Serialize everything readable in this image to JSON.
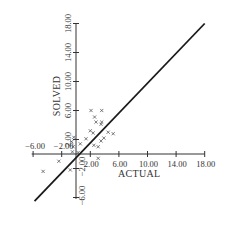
{
  "chart_data": {
    "type": "scatter",
    "title": "",
    "xlabel": "ACTUAL",
    "ylabel": "SOLVED",
    "xlim": [
      -8,
      18
    ],
    "ylim": [
      -7,
      18
    ],
    "grid": false,
    "legend": null,
    "x_ticks": [
      -6,
      -2,
      2,
      6,
      10,
      14,
      18
    ],
    "y_ticks": [
      -6,
      -2,
      2,
      6,
      10,
      14,
      18
    ],
    "x_tick_labels": [
      "−6.00",
      "−2.00",
      "2.00",
      "6.00",
      "10.00",
      "14.00",
      "18.00"
    ],
    "y_tick_labels": [
      "−6.00",
      "−2.00",
      "2.00",
      "6.00",
      "10.00",
      "14.00",
      "18.00"
    ],
    "reference_line": {
      "name": "y = x",
      "from": [
        -5.8,
        -6.5
      ],
      "to": [
        18,
        18
      ]
    },
    "series": [
      {
        "name": "points",
        "marker": "x",
        "points": [
          [
            2.1,
            6.0
          ],
          [
            3.6,
            6.0
          ],
          [
            2.6,
            5.1
          ],
          [
            2.8,
            4.4
          ],
          [
            3.6,
            4.4
          ],
          [
            3.5,
            4.1
          ],
          [
            2.0,
            3.2
          ],
          [
            2.4,
            2.9
          ],
          [
            4.5,
            3.0
          ],
          [
            5.2,
            2.8
          ],
          [
            3.9,
            2.2
          ],
          [
            3.5,
            1.8
          ],
          [
            1.4,
            2.1
          ],
          [
            2.5,
            1.2
          ],
          [
            3.1,
            1.0
          ],
          [
            0.6,
            1.4
          ],
          [
            -0.6,
            1.7
          ],
          [
            -0.4,
            1.0
          ],
          [
            -0.3,
            2.3
          ],
          [
            3.1,
            -0.6
          ],
          [
            -2.4,
            -1.0
          ],
          [
            -4.6,
            -2.4
          ],
          [
            -0.8,
            -2.2
          ],
          [
            0.3,
            0.2
          ],
          [
            -0.5,
            0.3
          ]
        ]
      }
    ]
  }
}
